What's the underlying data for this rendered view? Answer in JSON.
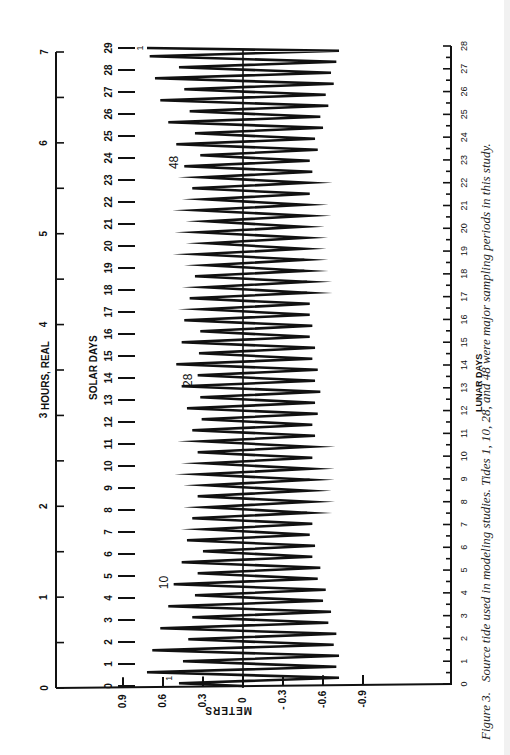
{
  "figure": {
    "number_label": "Figure 3.",
    "caption": "Source tide used in modeling studies. Tides 1, 10, 28, and 48 were major sampling periods in this study."
  },
  "chart_data": {
    "type": "line",
    "orientation": "rotated-90-ccw",
    "title": "",
    "axes": {
      "hours": {
        "label": "HOURS, REAL",
        "ticks": [
          0,
          1,
          2,
          3,
          4,
          5,
          6,
          7
        ],
        "range": [
          0,
          7
        ],
        "minor_ticks_every": 0.5
      },
      "solar_days": {
        "label": "SOLAR DAYS",
        "ticks": [
          0,
          1,
          2,
          3,
          4,
          5,
          6,
          7,
          8,
          9,
          10,
          11,
          12,
          13,
          14,
          15,
          16,
          17,
          18,
          19,
          20,
          21,
          22,
          23,
          24,
          25,
          26,
          27,
          28,
          29
        ],
        "range": [
          0,
          29
        ]
      },
      "meters": {
        "label": "METERS",
        "ticks": [
          "0.9",
          "0.6",
          "0.3",
          "0",
          "- 0.3",
          "-0.6",
          "-0.9"
        ],
        "tick_values": [
          0.9,
          0.6,
          0.3,
          0,
          -0.3,
          -0.6,
          -0.9
        ],
        "range": [
          -0.9,
          0.9
        ]
      },
      "lunar_days": {
        "label": "LUNAR DAYS",
        "ticks": [
          0,
          1,
          2,
          3,
          4,
          5,
          6,
          7,
          8,
          9,
          10,
          11,
          12,
          13,
          14,
          15,
          16,
          17,
          18,
          19,
          20,
          21,
          22,
          23,
          24,
          25,
          26,
          27,
          28
        ],
        "range": [
          0,
          28
        ],
        "minor_ticks_every": 0.5
      }
    },
    "annotations": [
      {
        "text": "1",
        "solar_day": 0.35
      },
      {
        "text": "10",
        "solar_day": 4.7
      },
      {
        "text": "28",
        "solar_day": 13.9
      },
      {
        "text": "48",
        "solar_day": 23.8
      },
      {
        "text": "1",
        "solar_day": 29.0
      }
    ],
    "series": [
      {
        "name": "Source tide (mixed semidiurnal)",
        "x_unit": "solar_days",
        "high_tides": [
          0.48,
          0.72,
          0.45,
          0.68,
          0.41,
          0.62,
          0.38,
          0.56,
          0.36,
          0.52,
          0.34,
          0.46,
          0.3,
          0.42,
          0.28,
          0.38,
          0.27,
          0.34,
          0.27,
          0.32,
          0.28,
          0.34,
          0.3,
          0.38,
          0.31,
          0.42,
          0.32,
          0.46,
          0.34,
          0.5,
          0.33,
          0.46,
          0.32,
          0.44,
          0.3,
          0.4,
          0.28,
          0.36,
          0.27,
          0.34,
          0.26,
          0.33,
          0.26,
          0.34,
          0.28,
          0.38,
          0.3,
          0.44,
          0.32,
          0.5,
          0.36,
          0.56,
          0.4,
          0.62,
          0.44,
          0.66,
          0.48,
          0.7
        ],
        "low_tides": [
          -0.72,
          -0.7,
          -0.72,
          -0.68,
          -0.7,
          -0.64,
          -0.66,
          -0.6,
          -0.62,
          -0.56,
          -0.58,
          -0.52,
          -0.54,
          -0.5,
          -0.52,
          -0.48,
          -0.5,
          -0.48,
          -0.5,
          -0.5,
          -0.52,
          -0.5,
          -0.54,
          -0.52,
          -0.56,
          -0.54,
          -0.58,
          -0.54,
          -0.56,
          -0.52,
          -0.54,
          -0.5,
          -0.52,
          -0.5,
          -0.5,
          -0.48,
          -0.48,
          -0.46,
          -0.46,
          -0.45,
          -0.46,
          -0.44,
          -0.48,
          -0.46,
          -0.5,
          -0.48,
          -0.52,
          -0.5,
          -0.56,
          -0.54,
          -0.6,
          -0.58,
          -0.64,
          -0.62,
          -0.68,
          -0.66,
          -0.7,
          -0.72
        ]
      }
    ],
    "grid": false,
    "legend": null
  }
}
